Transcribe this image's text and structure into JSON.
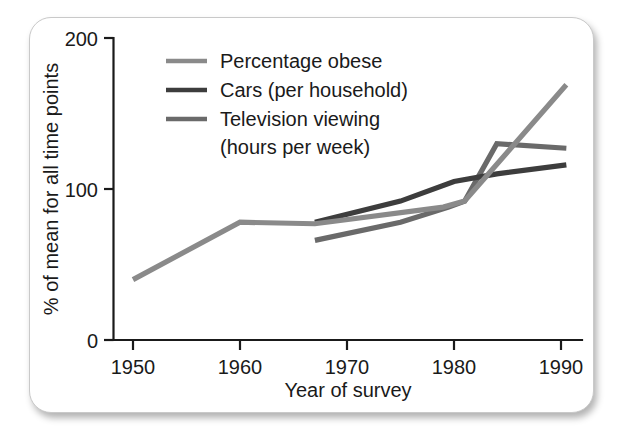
{
  "figure": {
    "background_color": "#ffffff",
    "card_border_color": "#c9c9c9"
  },
  "chart_data": {
    "type": "line",
    "title": "",
    "xlabel": "Year of survey",
    "ylabel": "% of mean for all time points",
    "xlim": [
      1948,
      1992
    ],
    "ylim": [
      0,
      200
    ],
    "xticks": [
      1950,
      1960,
      1970,
      1980,
      1990
    ],
    "xtick_labels": [
      "1950",
      "1960",
      "1970",
      "1980",
      "1990"
    ],
    "yticks": [
      0,
      100,
      200
    ],
    "ytick_labels": [
      "0",
      "100",
      "200"
    ],
    "grid": false,
    "legend_position": "upper left inside",
    "series": [
      {
        "name": "Percentage obese",
        "color": "#8a8a8a",
        "x": [
          1950,
          1960,
          1967,
          1979,
          1981,
          1990.5
        ],
        "values": [
          40,
          78,
          77,
          88,
          92,
          169
        ]
      },
      {
        "name": "Cars (per household)",
        "color": "#3d3d3d",
        "x": [
          1967,
          1975,
          1980,
          1984,
          1990.5
        ],
        "values": [
          78,
          92,
          105,
          110,
          116
        ]
      },
      {
        "name": "Television viewing (hours per week)",
        "color": "#6a6a6a",
        "x": [
          1967,
          1975,
          1979.5,
          1981,
          1984,
          1990.5
        ],
        "values": [
          66,
          78,
          88,
          92,
          130,
          127
        ]
      }
    ]
  },
  "legend": {
    "entries": [
      {
        "label": "Percentage obese",
        "color": "#8a8a8a"
      },
      {
        "label": "Cars (per household)",
        "color": "#3d3d3d"
      },
      {
        "label": "Television viewing",
        "color": "#6a6a6a"
      }
    ],
    "continuation_line": "(hours per week)"
  },
  "axes": {
    "x_title": "Year of survey",
    "y_title": "% of mean for all time points",
    "x_tick_labels": [
      "1950",
      "1960",
      "1970",
      "1980",
      "1990"
    ],
    "y_tick_labels": [
      "200",
      "100",
      "0"
    ]
  }
}
